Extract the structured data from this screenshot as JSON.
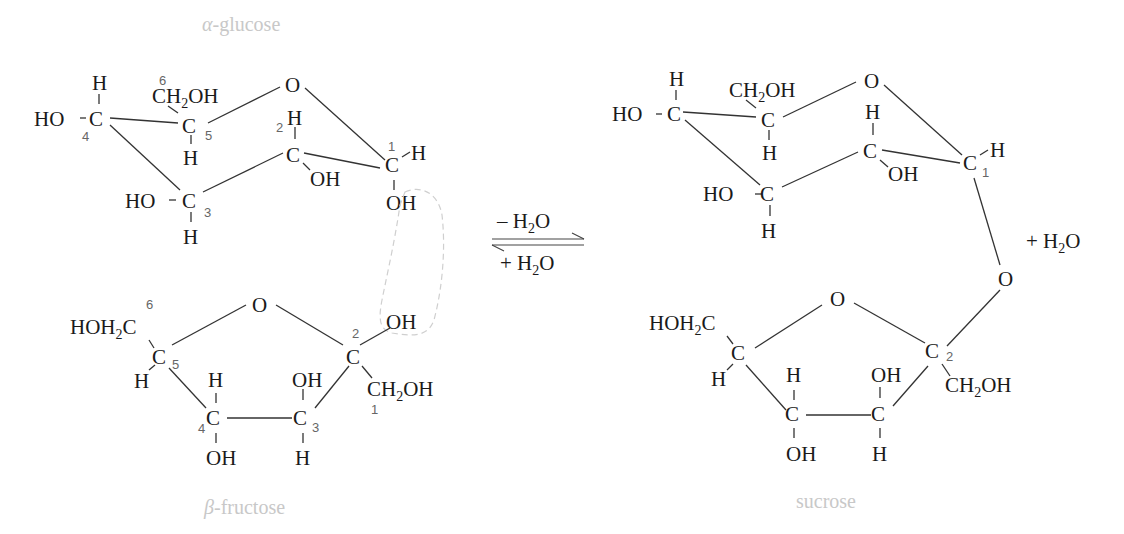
{
  "molecules": {
    "glucose": {
      "label_prefix": "α",
      "label_suffix": "-glucose",
      "atoms": {
        "ho_c4": "HO",
        "h_c4": "H",
        "c4": "C",
        "n4": "4",
        "n6": "6",
        "ch2oh": "CH",
        "ch2oh_sub": "2",
        "ch2oh_tail": "OH",
        "c5": "C",
        "n5": "5",
        "h_c5": "H",
        "ring_o": "O",
        "n2": "2",
        "h_c2": "H",
        "c2": "C",
        "oh_c2": "OH",
        "n1": "1",
        "c1": "C",
        "h_c1": "H",
        "oh_c1": "OH",
        "ho_c3": "HO",
        "c3": "C",
        "n3": "3",
        "h_c3": "H"
      }
    },
    "fructose": {
      "label_prefix": "β",
      "label_suffix": "-fructose",
      "atoms": {
        "n6": "6",
        "hoh2c": "HOH",
        "hoh2c_sub": "2",
        "hoh2c_tail": "C",
        "c5": "C",
        "n5": "5",
        "h_c5": "H",
        "ring_o": "O",
        "n2": "2",
        "c2": "C",
        "oh_c2": "OH",
        "ch2oh": "CH",
        "ch2oh_sub": "2",
        "ch2oh_tail": "OH",
        "n1": "1",
        "h_c4": "H",
        "c4": "C",
        "n4": "4",
        "oh_c4": "OH",
        "oh_c3": "OH",
        "c3": "C",
        "n3": "3",
        "h_c3": "H"
      }
    },
    "sucrose": {
      "label": "sucrose",
      "atoms": {
        "ho_c4": "HO",
        "h_c4": "H",
        "c4": "C",
        "ch2oh": "CH",
        "ch2oh_sub": "2",
        "ch2oh_tail": "OH",
        "c5": "C",
        "h_c5": "H",
        "ring_o": "O",
        "h_c2": "H",
        "c2": "C",
        "oh_c2": "OH",
        "c1": "C",
        "n1": "1",
        "h_c1": "H",
        "ho_c3": "HO",
        "c3": "C",
        "h_c3": "H",
        "bridge_o": "O",
        "f_hoh2c": "HOH",
        "f_hoh2c_sub": "2",
        "f_hoh2c_tail": "C",
        "f_c5": "C",
        "f_h_c5": "H",
        "f_ring_o": "O",
        "f_c2": "C",
        "f_n2": "2",
        "f_ch2oh": "CH",
        "f_ch2oh_sub": "2",
        "f_ch2oh_tail": "OH",
        "f_h_c4": "H",
        "f_c4": "C",
        "f_oh_c4": "OH",
        "f_oh_c3": "OH",
        "f_c3": "C",
        "f_h_c3": "H"
      }
    }
  },
  "reaction": {
    "forward_sign": "– H",
    "forward_sub": "2",
    "forward_tail": "O",
    "reverse_sign": "+ H",
    "reverse_sub": "2",
    "reverse_tail": "O",
    "byproduct_sign": "+ H",
    "byproduct_sub": "2",
    "byproduct_tail": "O"
  },
  "colors": {
    "structure": "#1a1a1a",
    "carbon_numbers": "#666666",
    "molecule_labels": "#c8c8c8",
    "highlight_dash": "#cfcfcf"
  }
}
